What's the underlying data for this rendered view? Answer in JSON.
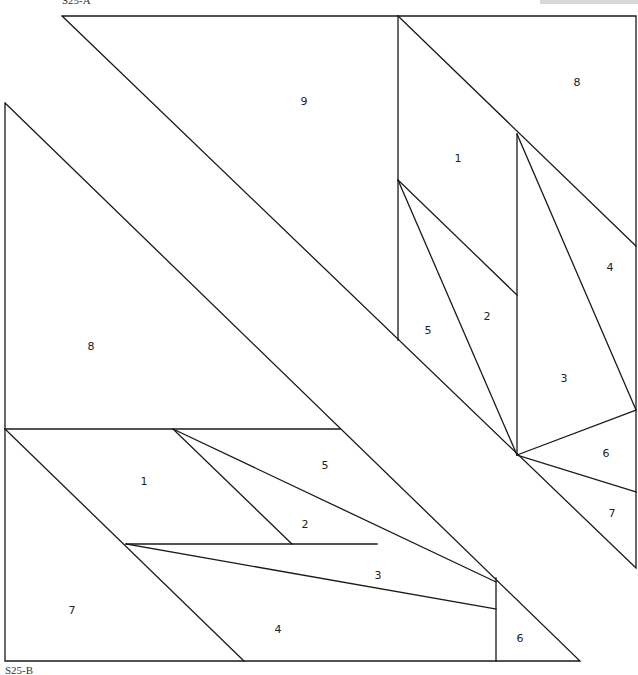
{
  "captions": {
    "section_a": "S25-A",
    "section_b": "S25-B"
  },
  "section_a": {
    "pieces": [
      {
        "id": "a-1",
        "label": "1",
        "x": 458,
        "y": 159
      },
      {
        "id": "a-2",
        "label": "2",
        "x": 487,
        "y": 317
      },
      {
        "id": "a-3",
        "label": "3",
        "x": 564,
        "y": 379
      },
      {
        "id": "a-4",
        "label": "4",
        "x": 610,
        "y": 268
      },
      {
        "id": "a-5",
        "label": "5",
        "x": 428,
        "y": 331
      },
      {
        "id": "a-6",
        "label": "6",
        "x": 606,
        "y": 454
      },
      {
        "id": "a-7",
        "label": "7",
        "x": 612,
        "y": 514
      },
      {
        "id": "a-8",
        "label": "8",
        "x": 577,
        "y": 83
      },
      {
        "id": "a-9",
        "label": "9",
        "x": 304,
        "y": 102
      }
    ]
  },
  "section_b": {
    "pieces": [
      {
        "id": "b-1",
        "label": "1",
        "x": 144,
        "y": 482
      },
      {
        "id": "b-2",
        "label": "2",
        "x": 305,
        "y": 525
      },
      {
        "id": "b-3",
        "label": "3",
        "x": 378,
        "y": 576
      },
      {
        "id": "b-4",
        "label": "4",
        "x": 278,
        "y": 630
      },
      {
        "id": "b-5",
        "label": "5",
        "x": 325,
        "y": 466
      },
      {
        "id": "b-6",
        "label": "6",
        "x": 520,
        "y": 639
      },
      {
        "id": "b-7",
        "label": "7",
        "x": 72,
        "y": 611
      },
      {
        "id": "b-8",
        "label": "8",
        "x": 91,
        "y": 347
      }
    ]
  },
  "colors": {
    "line": "#1a1a1a",
    "background": "#ffffff",
    "label": "#222222"
  }
}
